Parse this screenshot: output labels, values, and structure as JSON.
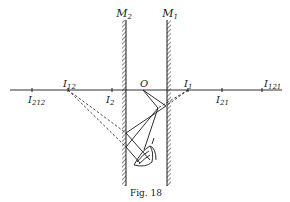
{
  "figure": {
    "caption": "Fig. 18",
    "mirrors": [
      {
        "id": "M2",
        "label": "M",
        "sub": "2"
      },
      {
        "id": "M1",
        "label": "M",
        "sub": "1"
      }
    ],
    "points": {
      "O": {
        "label": "O"
      },
      "I1": {
        "label": "I",
        "sub": "1"
      },
      "I2": {
        "label": "I",
        "sub": "2"
      },
      "I12": {
        "label": "I",
        "sub": "12"
      },
      "I21": {
        "label": "I",
        "sub": "21"
      },
      "I212": {
        "label": "I",
        "sub": "212"
      },
      "I121": {
        "label": "I",
        "sub": "121"
      }
    },
    "colors": {
      "ink": "#1a1a1a",
      "background": "#ffffff"
    }
  }
}
